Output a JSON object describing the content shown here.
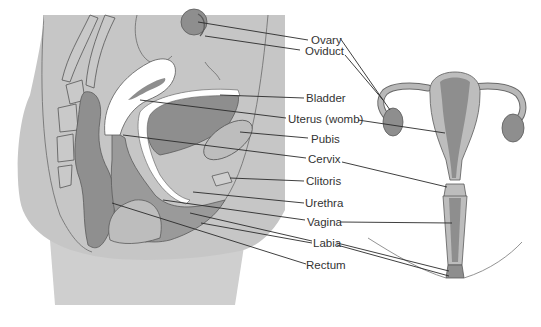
{
  "diagram": {
    "views": [
      "sagittal-section",
      "frontal-view"
    ],
    "colors": {
      "body_light": "#c9c9c9",
      "body_mid": "#b4b4b4",
      "organ_dark": "#8e8e8e",
      "white": "#ffffff",
      "outline": "#5a5a5a",
      "leader": "#2a2a2a"
    },
    "labels": [
      {
        "id": "ovary",
        "text": "Ovary"
      },
      {
        "id": "oviduct",
        "text": "Oviduct"
      },
      {
        "id": "bladder",
        "text": "Bladder"
      },
      {
        "id": "uterus",
        "text": "Uterus (womb)"
      },
      {
        "id": "pubis",
        "text": "Pubis"
      },
      {
        "id": "cervix",
        "text": "Cervix"
      },
      {
        "id": "clitoris",
        "text": "Clitoris"
      },
      {
        "id": "urethra",
        "text": "Urethra"
      },
      {
        "id": "vagina",
        "text": "Vagina"
      },
      {
        "id": "labia",
        "text": "Labia"
      },
      {
        "id": "rectum",
        "text": "Rectum"
      }
    ]
  }
}
